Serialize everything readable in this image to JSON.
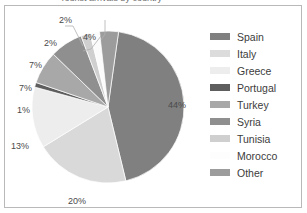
{
  "title_remnant": "Tourist arrivals by country",
  "chart_data": {
    "type": "pie",
    "title": "",
    "xlabel": "",
    "ylabel": "",
    "legend_position": "right",
    "grid": false,
    "categories": [
      "Spain",
      "Italy",
      "Greece",
      "Portugal",
      "Turkey",
      "Syria",
      "Tunisia",
      "Morocco",
      "Other"
    ],
    "values": [
      44,
      20,
      13,
      1,
      7,
      7,
      2,
      2,
      4
    ],
    "value_labels": [
      "44%",
      "20%",
      "13%",
      "1%",
      "7%",
      "7%",
      "2%",
      "2%",
      "4%"
    ],
    "colors": [
      "#808080",
      "#d9d9d9",
      "#ededed",
      "#5e5e5e",
      "#a8a8a8",
      "#8f8f8f",
      "#cfcfcf",
      "#fbfbfb",
      "#9c9c9c"
    ],
    "start_angle_deg": 8,
    "units": "percent"
  },
  "legend": {
    "items": [
      {
        "label": "Spain",
        "color": "#808080"
      },
      {
        "label": "Italy",
        "color": "#dcdcdc"
      },
      {
        "label": "Greece",
        "color": "#ededed"
      },
      {
        "label": "Portugal",
        "color": "#5e5e5e"
      },
      {
        "label": "Turkey",
        "color": "#a8a8a8"
      },
      {
        "label": "Syria",
        "color": "#8f8f8f"
      },
      {
        "label": "Tunisia",
        "color": "#cfcfcf"
      },
      {
        "label": "Morocco",
        "color": "#fdfdfd"
      },
      {
        "label": "Other",
        "color": "#9c9c9c"
      }
    ]
  },
  "labels": {
    "spain": {
      "text": "44%",
      "left": 163,
      "top": 94
    },
    "italy": {
      "text": "20%",
      "left": 63,
      "top": 190
    },
    "greece": {
      "text": "13%",
      "left": 6,
      "top": 135
    },
    "portugal": {
      "text": "1%",
      "top": 99,
      "left": 12
    },
    "turkey": {
      "text": "7%",
      "left": 14,
      "top": 77
    },
    "syria": {
      "text": "7%",
      "left": 24,
      "top": 54
    },
    "tunisia": {
      "text": "2%",
      "left": 39,
      "top": 32
    },
    "morocco": {
      "text": "2%",
      "left": 54,
      "top": 9
    },
    "other": {
      "text": "4%",
      "left": 78,
      "top": 26
    }
  }
}
